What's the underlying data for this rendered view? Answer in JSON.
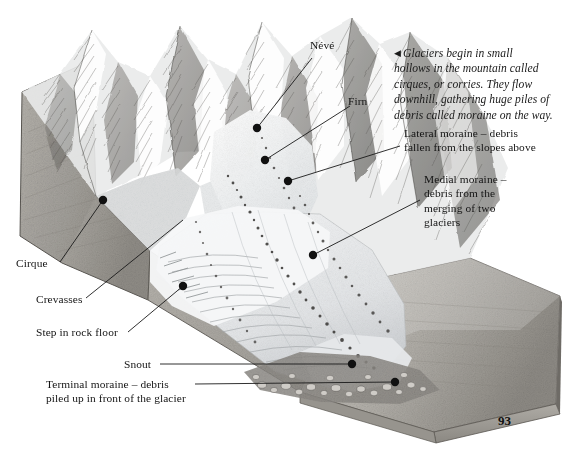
{
  "page": {
    "number": "93",
    "background": "#ffffff",
    "ink": "#141414"
  },
  "intro": {
    "marker": "◀",
    "text": "Glaciers begin in small\nhollows in the mountain called\ncirques, or corries. They flow\ndownhill, gathering huge piles of\ndebris called moraine on the way."
  },
  "labels": {
    "neve": "Névé",
    "firn": "Firn",
    "lateral_moraine": "Lateral moraine – debris\nfallen from the slopes above",
    "medial_moraine": "Medial moraine –\ndebris from the\nmerging of two\nglaciers",
    "cirque": "Cirque",
    "crevasses": "Crevasses",
    "step_in_rock_floor": "Step in rock floor",
    "snout": "Snout",
    "terminal_moraine": "Terminal moraine – debris\npiled up in front of the glacier"
  },
  "figure": {
    "colors": {
      "ice": "#f3f4f4",
      "ice_shadow": "#d2d5d7",
      "rock_light": "#b8b6b1",
      "rock_mid": "#9a9790",
      "rock_dark": "#6f6d68",
      "ground_side": "#a9a6a0",
      "moraine_debris": "#4a4846",
      "outline": "#2a2a2a"
    }
  },
  "leaders": {
    "neve": {
      "dot": [
        257,
        128
      ]
    },
    "firn": {
      "dot": [
        265,
        160
      ]
    },
    "lateral_moraine": {
      "dot": [
        288,
        181
      ]
    },
    "medial_moraine": {
      "dot": [
        313,
        255
      ]
    },
    "cirque": {
      "dot": [
        103,
        200
      ]
    },
    "crevasses": {
      "dot": [
        183,
        286
      ]
    },
    "step_in_rock_floor": {
      "dot": [
        183,
        286
      ]
    },
    "snout": {
      "dot": [
        352,
        364
      ]
    },
    "terminal_moraine": {
      "dot": [
        395,
        382
      ]
    }
  }
}
